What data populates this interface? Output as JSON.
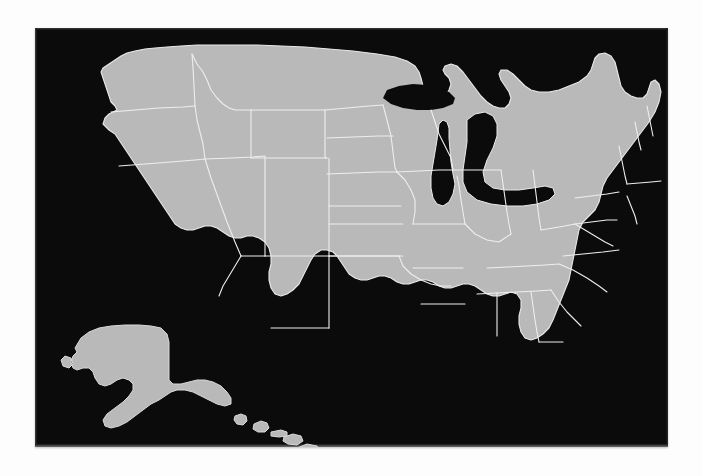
{
  "figure": {
    "kind": "map",
    "background_color": "#fdfdfd"
  },
  "panel": {
    "background_color": "#0b0b0b",
    "x": 35,
    "y": 28,
    "width": 633,
    "height": 419
  },
  "map": {
    "region": "United States of America",
    "projection": "albers-usa",
    "land_color": "#b9b9b9",
    "border_color": "#eeeeee",
    "water_color": "#0b0b0b",
    "shows_state_boundaries": true,
    "insets": [
      {
        "name": "Alaska",
        "position": "lower-left"
      },
      {
        "name": "Hawaii",
        "position": "lower-center-left"
      }
    ],
    "features": [
      "contiguous-united-states",
      "great-lakes",
      "florida-peninsula",
      "chesapeake-bay",
      "cape-cod",
      "long-island",
      "gulf-of-mexico",
      "pacific-coast",
      "atlantic-coast"
    ],
    "states": [
      "Washington",
      "Oregon",
      "California",
      "Nevada",
      "Idaho",
      "Montana",
      "Wyoming",
      "Utah",
      "Arizona",
      "Colorado",
      "New Mexico",
      "North Dakota",
      "South Dakota",
      "Nebraska",
      "Kansas",
      "Oklahoma",
      "Texas",
      "Minnesota",
      "Iowa",
      "Missouri",
      "Arkansas",
      "Louisiana",
      "Wisconsin",
      "Illinois",
      "Michigan",
      "Indiana",
      "Ohio",
      "Kentucky",
      "Tennessee",
      "Mississippi",
      "Alabama",
      "Georgia",
      "Florida",
      "South Carolina",
      "North Carolina",
      "Virginia",
      "West Virginia",
      "Maryland",
      "Delaware",
      "Pennsylvania",
      "New Jersey",
      "New York",
      "Connecticut",
      "Rhode Island",
      "Massachusetts",
      "Vermont",
      "New Hampshire",
      "Maine",
      "Alaska",
      "Hawaii"
    ],
    "labels": []
  }
}
